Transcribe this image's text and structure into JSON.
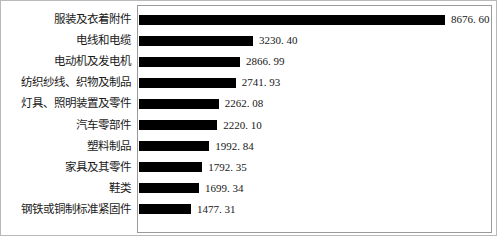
{
  "chart_data": {
    "type": "bar",
    "orientation": "horizontal",
    "title": "",
    "subtitle": "",
    "xlabel": "",
    "ylabel": "",
    "grid": false,
    "legend": null,
    "legend_position": "none",
    "bar_color": "#000000",
    "plot_border_color": "#9a9a9a",
    "figure_border_color": "#b9b9b9",
    "xlim": [
      0,
      8676.6
    ],
    "categories": [
      "服装及衣着附件",
      "电线和电缆",
      "电动机及发电机",
      "纺织纱线、织物及制品",
      "灯具、照明装置及零件",
      "汽车零部件",
      "塑料制品",
      "家具及其零件",
      "鞋类",
      "钢铁或铜制标准紧固件"
    ],
    "values": [
      8676.6,
      3230.4,
      2866.99,
      2741.93,
      2262.08,
      2220.1,
      1992.84,
      1792.35,
      1699.34,
      1477.31
    ],
    "value_labels": [
      "8676. 60",
      "3230. 40",
      "2866. 99",
      "2741. 93",
      "2262. 08",
      "2220. 10",
      "1992. 84",
      "1792. 35",
      "1699. 34",
      "1477. 31"
    ]
  }
}
